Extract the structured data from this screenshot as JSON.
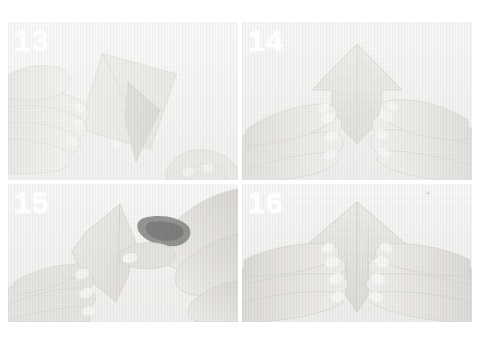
{
  "page": {
    "background_color": "#ffffff",
    "kind": "scanned-instruction-photo-sequence"
  },
  "grid": {
    "columns": 2,
    "rows": 2
  },
  "panels": [
    {
      "id": "panel-13",
      "step_number": "13",
      "number_color": "#ffffff",
      "caption": "Hands holding a diamond-folded paper at an angle with a narrow flap lifted"
    },
    {
      "id": "panel-14",
      "step_number": "14",
      "number_color": "#ffffff",
      "caption": "Both hands flattening a symmetric arrow-shaped fold on the table"
    },
    {
      "id": "panel-15",
      "step_number": "15",
      "number_color": "#ffffff",
      "caption": "Right hand pinching and pulling a point of the folded paper"
    },
    {
      "id": "panel-16",
      "step_number": "16",
      "number_color": "#ffffff",
      "caption": "Both hands pressing the finished symmetric arrow fold flat"
    }
  ],
  "colors": {
    "paper_light": "#e8e7e3",
    "paper_mid": "#dcdbd6",
    "paper_shadow": "#cfcec9",
    "skin_light": "#eceae6",
    "skin_mid": "#dddbd6",
    "skin_shadow": "#c9c6c0",
    "table_background": "#f2f2f1",
    "dark_accent": "#4a4a4a"
  }
}
